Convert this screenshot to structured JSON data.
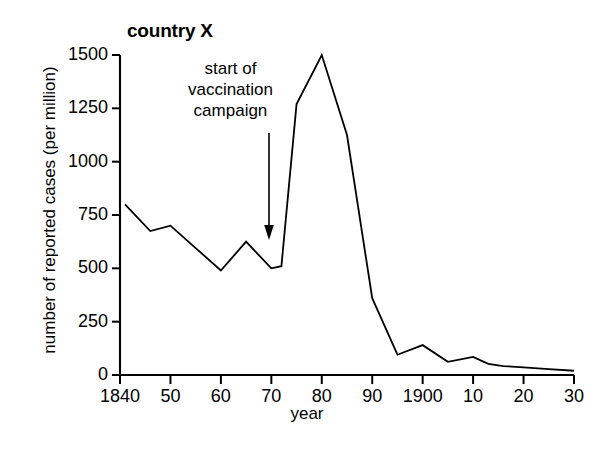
{
  "figure": {
    "title": "country X",
    "background_color": "#ffffff",
    "line_color": "#000000",
    "axis_color": "#000000"
  },
  "annotation": {
    "text": "start of\nvaccination\ncampaign",
    "arrow_name": "annotation-arrow",
    "points_to_year": 1870
  },
  "chart_data": {
    "type": "line",
    "title": "country X",
    "xlabel": "year",
    "ylabel": "number of reported cases (per million)",
    "xlim": [
      1840,
      1930
    ],
    "ylim": [
      0,
      1500
    ],
    "grid": false,
    "legend": "none",
    "x_tick_labels": [
      "1840",
      "50",
      "60",
      "70",
      "80",
      "90",
      "1900",
      "10",
      "20",
      "30"
    ],
    "x_tick_values": [
      1840,
      1850,
      1860,
      1870,
      1880,
      1890,
      1900,
      1910,
      1920,
      1930
    ],
    "y_tick_labels": [
      "0",
      "250",
      "500",
      "750",
      "1000",
      "1250",
      "1500"
    ],
    "y_tick_values": [
      0,
      250,
      500,
      750,
      1000,
      1250,
      1500
    ],
    "series": [
      {
        "name": "reported cases per million",
        "x": [
          1841,
          1846,
          1850,
          1855,
          1860,
          1865,
          1870,
          1872,
          1875,
          1880,
          1885,
          1890,
          1895,
          1900,
          1905,
          1910,
          1913,
          1916,
          1920,
          1925,
          1930
        ],
        "values": [
          800,
          675,
          700,
          595,
          490,
          625,
          500,
          510,
          1270,
          1500,
          1125,
          360,
          95,
          140,
          62,
          85,
          52,
          42,
          36,
          28,
          20
        ]
      }
    ],
    "annotations": [
      {
        "text": "start of vaccination campaign",
        "x": 1870,
        "y": 500
      }
    ]
  }
}
